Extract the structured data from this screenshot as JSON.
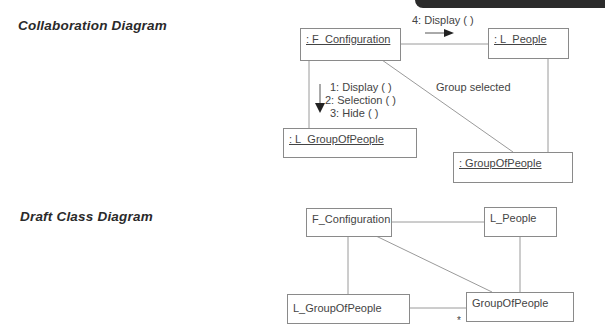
{
  "headings": {
    "collaboration": "Collaboration Diagram",
    "draft_class": "Draft Class Diagram"
  },
  "collaboration": {
    "objects": [
      {
        "id": "f_configuration",
        "label": ": F_Configuration"
      },
      {
        "id": "l_people",
        "label": ": L_People"
      },
      {
        "id": "l_groupofpeople",
        "label": ": L_GroupOfPeople"
      },
      {
        "id": "groupofpeople",
        "label": ": GroupOfPeople"
      }
    ],
    "messages": {
      "to_l_people": "4: Display ( )",
      "to_l_groupofpeople": [
        "1: Display ( )",
        "2: Selection ( )",
        "3: Hide ( )"
      ]
    },
    "link_label": "Group selected"
  },
  "class_diagram": {
    "classes": [
      {
        "id": "f_configuration",
        "label": "F_Configuration"
      },
      {
        "id": "l_people",
        "label": "L_People"
      },
      {
        "id": "l_groupofpeople",
        "label": "L_GroupOfPeople"
      },
      {
        "id": "groupofpeople",
        "label": "GroupOfPeople"
      }
    ],
    "multiplicity": "*"
  },
  "colors": {
    "line": "#9a9a9a",
    "box_border": "#8a8a8a",
    "text": "#444444",
    "corner_band": "#2b2b2b"
  }
}
